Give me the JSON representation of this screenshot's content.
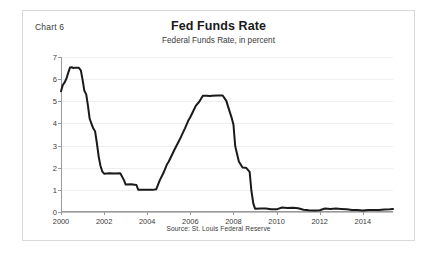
{
  "figure": {
    "chart_number": "Chart 6",
    "title": "Fed Funds Rate",
    "subtitle": "Federal Funds Rate, in percent",
    "source": "Source: St. Louis Federal Reserve",
    "border_color": "#d9d9d9"
  },
  "chart_data": {
    "type": "line",
    "title": "Fed Funds Rate",
    "subtitle": "Federal Funds Rate, in percent",
    "xlabel": "",
    "ylabel": "",
    "xlim": [
      2000.0,
      2015.4
    ],
    "ylim": [
      0,
      7
    ],
    "xticks": [
      "2000",
      "2002",
      "2004",
      "2006",
      "2008",
      "2010",
      "2012",
      "2014"
    ],
    "xtick_values": [
      2000,
      2002,
      2004,
      2006,
      2008,
      2010,
      2012,
      2014
    ],
    "yticks": [
      "0",
      "1",
      "2",
      "3",
      "4",
      "5",
      "6",
      "7"
    ],
    "ytick_values": [
      0,
      1,
      2,
      3,
      4,
      5,
      6,
      7
    ],
    "grid": "horizontal",
    "legend": "none",
    "line_color": "#1a1a1a",
    "line_width": 2,
    "series": [
      {
        "name": "Federal Funds Rate",
        "x": [
          2000.0,
          2000.08,
          2000.17,
          2000.25,
          2000.33,
          2000.42,
          2000.5,
          2000.58,
          2000.67,
          2000.75,
          2000.83,
          2000.92,
          2001.0,
          2001.08,
          2001.17,
          2001.25,
          2001.33,
          2001.42,
          2001.5,
          2001.58,
          2001.67,
          2001.75,
          2001.83,
          2001.92,
          2002.0,
          2002.25,
          2002.5,
          2002.75,
          2002.92,
          2003.0,
          2003.25,
          2003.5,
          2003.58,
          2003.75,
          2004.0,
          2004.25,
          2004.42,
          2004.58,
          2004.75,
          2004.92,
          2005.0,
          2005.25,
          2005.5,
          2005.75,
          2005.92,
          2006.0,
          2006.25,
          2006.42,
          2006.58,
          2006.75,
          2006.92,
          2007.0,
          2007.25,
          2007.5,
          2007.67,
          2007.75,
          2007.92,
          2008.0,
          2008.08,
          2008.17,
          2008.25,
          2008.42,
          2008.58,
          2008.75,
          2008.83,
          2008.92,
          2009.0,
          2009.25,
          2009.5,
          2009.75,
          2010.0,
          2010.25,
          2010.5,
          2010.75,
          2011.0,
          2011.25,
          2011.5,
          2011.75,
          2012.0,
          2012.25,
          2012.5,
          2012.75,
          2013.0,
          2013.25,
          2013.5,
          2013.75,
          2014.0,
          2014.25,
          2014.5,
          2014.75,
          2015.0,
          2015.25,
          2015.4
        ],
        "y": [
          5.45,
          5.73,
          5.85,
          6.02,
          6.27,
          6.53,
          6.54,
          6.5,
          6.52,
          6.51,
          6.51,
          6.4,
          5.98,
          5.49,
          5.31,
          4.8,
          4.21,
          3.97,
          3.77,
          3.65,
          3.07,
          2.49,
          2.09,
          1.82,
          1.73,
          1.75,
          1.74,
          1.75,
          1.44,
          1.24,
          1.25,
          1.22,
          1.01,
          1.01,
          1.0,
          1.0,
          1.03,
          1.43,
          1.76,
          2.16,
          2.28,
          2.79,
          3.26,
          3.78,
          4.16,
          4.29,
          4.79,
          4.99,
          5.25,
          5.25,
          5.24,
          5.25,
          5.26,
          5.26,
          5.02,
          4.76,
          4.24,
          3.94,
          2.98,
          2.61,
          2.28,
          2.01,
          2.0,
          1.81,
          0.97,
          0.39,
          0.15,
          0.16,
          0.16,
          0.12,
          0.12,
          0.2,
          0.18,
          0.19,
          0.17,
          0.1,
          0.08,
          0.07,
          0.08,
          0.16,
          0.14,
          0.16,
          0.14,
          0.12,
          0.09,
          0.09,
          0.07,
          0.09,
          0.09,
          0.09,
          0.11,
          0.12,
          0.13
        ]
      }
    ]
  }
}
